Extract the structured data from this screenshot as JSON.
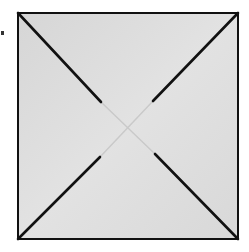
{
  "figure": {
    "paper_color": "#dcdcdc",
    "line_color": "#111111",
    "square": {
      "x1": 18,
      "y1": 13,
      "x2": 238,
      "y2": 239
    },
    "cuts": [
      {
        "name": "top-left",
        "from": [
          18,
          13
        ],
        "to": [
          101,
          102
        ]
      },
      {
        "name": "top-right",
        "from": [
          238,
          13
        ],
        "to": [
          153,
          101
        ]
      },
      {
        "name": "bottom-left",
        "from": [
          18,
          239
        ],
        "to": [
          100,
          157
        ]
      },
      {
        "name": "bottom-right",
        "from": [
          238,
          239
        ],
        "to": [
          155,
          154
        ]
      }
    ],
    "faint_folds": [
      {
        "from": [
          101,
          102
        ],
        "to": [
          155,
          154
        ]
      },
      {
        "from": [
          153,
          101
        ],
        "to": [
          100,
          157
        ]
      }
    ]
  }
}
